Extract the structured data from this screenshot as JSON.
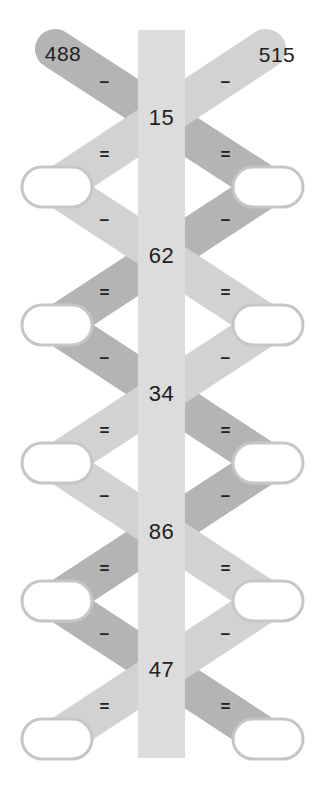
{
  "puzzle": {
    "title": "subtraction-chain-puzzle",
    "left_start": {
      "label": "488"
    },
    "right_start": {
      "label": "515"
    },
    "minus_sign": "−",
    "equals_sign": "=",
    "steps": [
      {
        "subtrahend": "15",
        "left_answer": "",
        "right_answer": ""
      },
      {
        "subtrahend": "62",
        "left_answer": "",
        "right_answer": ""
      },
      {
        "subtrahend": "34",
        "left_answer": "",
        "right_answer": ""
      },
      {
        "subtrahend": "86",
        "left_answer": "",
        "right_answer": ""
      },
      {
        "subtrahend": "47",
        "left_answer": "",
        "right_answer": ""
      }
    ]
  },
  "colors": {
    "background": "#ffffff",
    "ribbon_dark": "#b4b4b4",
    "ribbon_light": "#d2d2d2",
    "center_band": "#dcdcdc",
    "oval_border": "#c6c6c6",
    "oval_fill": "#ffffff",
    "text": "#212121"
  }
}
